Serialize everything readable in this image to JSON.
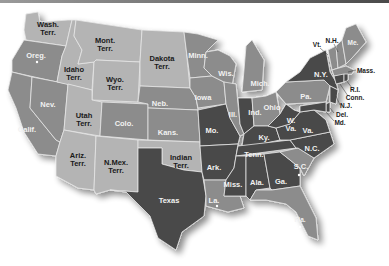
{
  "map": {
    "title": "United States map with states and territories",
    "colors": {
      "territory": "#b4b4b4",
      "state_medium": "#8c8c8c",
      "state_dark": "#484848",
      "border": "#e6e6e6",
      "background": "#ffffff"
    },
    "labels": {
      "wash": "Wash.",
      "wash2": "Terr.",
      "oreg": "Oreg.",
      "calif": "Calif.",
      "idaho": "Idaho",
      "idaho2": "Terr.",
      "nev": "Nev.",
      "mont": "Mont.",
      "mont2": "Terr.",
      "wyo": "Wyo.",
      "wyo2": "Terr.",
      "utah": "Utah",
      "utah2": "Terr.",
      "ariz": "Ariz.",
      "ariz2": "Terr.",
      "nmex": "N.Mex.",
      "nmex2": "Terr.",
      "colo": "Colo.",
      "dakota": "Dakota",
      "dakota2": "Terr.",
      "neb": "Neb.",
      "kans": "Kans.",
      "indian": "Indian",
      "indian2": "Terr.",
      "texas": "Texas",
      "minn": "Minn.",
      "iowa": "Iowa",
      "mo": "Mo.",
      "ark": "Ark.",
      "la": "La.",
      "wis": "Wis.",
      "ill": "Ill.",
      "mich": "Mich.",
      "ind": "Ind.",
      "ohio": "Ohio",
      "ky": "Ky.",
      "tenn": "Tenn.",
      "miss": "Miss.",
      "ala": "Ala.",
      "ga": "Ga.",
      "fla": "Fla.",
      "sc": "S.C.",
      "nc": "N.C.",
      "va": "Va.",
      "wva": "W.",
      "wva2": "Va.",
      "pa": "Pa.",
      "ny": "N.Y.",
      "vt": "Vt.",
      "nh": "N.H.",
      "me": "Me.",
      "mass": "Mass.",
      "ri": "R.I.",
      "conn": "Conn.",
      "nj": "N.J.",
      "del": "Del.",
      "md": "Md."
    }
  }
}
